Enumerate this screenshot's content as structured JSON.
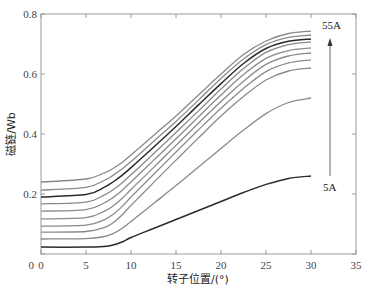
{
  "chart_data": {
    "type": "line",
    "title": "",
    "xlabel": "转子位置/(°)",
    "ylabel": "磁链/Wb",
    "xlim": [
      0,
      35
    ],
    "ylim": [
      0,
      0.8
    ],
    "xticks": [
      0,
      5,
      10,
      15,
      20,
      25,
      30,
      35
    ],
    "yticks": [
      0,
      0.2,
      0.4,
      0.6,
      0.8
    ],
    "xtick_labels": [
      "0",
      "5",
      "10",
      "15",
      "20",
      "25",
      "30",
      "35"
    ],
    "ytick_labels": [
      "0",
      "0.2",
      "0.4",
      "0.6",
      "0.8"
    ],
    "grid": false,
    "legend": null,
    "annotations": [
      {
        "text": "55A",
        "x": 32.5,
        "y": 0.75
      },
      {
        "text": "5A",
        "x": 32.5,
        "y": 0.2
      },
      {
        "arrow": "from 5A (bottom) up to 55A (top)",
        "x": 32.2,
        "y_from": 0.26,
        "y_to": 0.69
      }
    ],
    "x": [
      0,
      5,
      7,
      8,
      9,
      10,
      12.5,
      15,
      17.5,
      20,
      22.5,
      25,
      27.5,
      30
    ],
    "series": [
      {
        "name": "55A",
        "color": "#8a8a8a",
        "width": 1.3,
        "values": [
          0.24,
          0.25,
          0.27,
          0.285,
          0.305,
          0.33,
          0.395,
          0.46,
          0.53,
          0.6,
          0.665,
          0.71,
          0.735,
          0.743
        ]
      },
      {
        "name": "50A",
        "color": "#8a8a8a",
        "width": 1.3,
        "values": [
          0.213,
          0.222,
          0.245,
          0.262,
          0.283,
          0.308,
          0.375,
          0.442,
          0.513,
          0.585,
          0.65,
          0.698,
          0.722,
          0.73
        ]
      },
      {
        "name": "45A",
        "color": "#2b2b2b",
        "width": 1.5,
        "values": [
          0.19,
          0.198,
          0.222,
          0.24,
          0.262,
          0.288,
          0.356,
          0.425,
          0.497,
          0.568,
          0.635,
          0.685,
          0.709,
          0.717
        ]
      },
      {
        "name": "40A",
        "color": "#8a8a8a",
        "width": 1.3,
        "values": [
          0.167,
          0.173,
          0.196,
          0.214,
          0.237,
          0.264,
          0.334,
          0.405,
          0.477,
          0.55,
          0.618,
          0.672,
          0.698,
          0.707
        ]
      },
      {
        "name": "35A",
        "color": "#8a8a8a",
        "width": 1.3,
        "values": [
          0.143,
          0.148,
          0.17,
          0.188,
          0.212,
          0.24,
          0.312,
          0.384,
          0.457,
          0.53,
          0.598,
          0.652,
          0.678,
          0.687
        ]
      },
      {
        "name": "30A",
        "color": "#8a8a8a",
        "width": 1.3,
        "values": [
          0.117,
          0.121,
          0.142,
          0.16,
          0.185,
          0.215,
          0.288,
          0.362,
          0.436,
          0.508,
          0.576,
          0.632,
          0.66,
          0.67
        ]
      },
      {
        "name": "25A",
        "color": "#8a8a8a",
        "width": 1.3,
        "values": [
          0.093,
          0.096,
          0.114,
          0.132,
          0.158,
          0.19,
          0.265,
          0.34,
          0.414,
          0.486,
          0.552,
          0.608,
          0.637,
          0.647
        ]
      },
      {
        "name": "20A",
        "color": "#8a8a8a",
        "width": 1.3,
        "values": [
          0.073,
          0.075,
          0.088,
          0.104,
          0.13,
          0.162,
          0.238,
          0.313,
          0.387,
          0.46,
          0.525,
          0.58,
          0.61,
          0.62
        ]
      },
      {
        "name": "10A",
        "color": "#8a8a8a",
        "width": 1.3,
        "values": [
          0.05,
          0.051,
          0.058,
          0.068,
          0.085,
          0.108,
          0.168,
          0.228,
          0.29,
          0.352,
          0.413,
          0.468,
          0.505,
          0.52
        ]
      },
      {
        "name": "5A",
        "color": "#2b2b2b",
        "width": 1.5,
        "values": [
          0.023,
          0.023,
          0.025,
          0.03,
          0.04,
          0.055,
          0.085,
          0.115,
          0.145,
          0.175,
          0.205,
          0.232,
          0.252,
          0.26
        ]
      }
    ]
  }
}
